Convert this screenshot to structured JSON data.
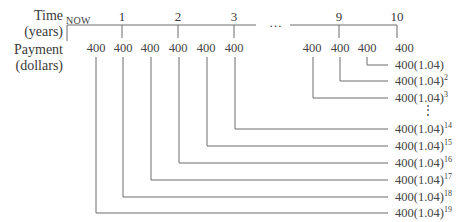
{
  "labels": {
    "time": "Time",
    "time_unit": "(years)",
    "payment": "Payment",
    "payment_unit": "(dollars)",
    "now": "NOW",
    "ellipsis": "…",
    "vdots": "⋮"
  },
  "time_ticks": [
    "1",
    "2",
    "3",
    "9",
    "10"
  ],
  "payments": [
    "400",
    "400",
    "400",
    "400",
    "400",
    "400",
    "400",
    "400",
    "400",
    "400"
  ],
  "future_values": [
    {
      "base": "400",
      "exp": ""
    },
    {
      "base": "400(1.04)",
      "exp": ""
    },
    {
      "base": "400(1.04)",
      "exp": "2"
    },
    {
      "base": "400(1.04)",
      "exp": "3"
    },
    {
      "base": "400(1.04)",
      "exp": "14"
    },
    {
      "base": "400(1.04)",
      "exp": "15"
    },
    {
      "base": "400(1.04)",
      "exp": "16"
    },
    {
      "base": "400(1.04)",
      "exp": "17"
    },
    {
      "base": "400(1.04)",
      "exp": "18"
    },
    {
      "base": "400(1.04)",
      "exp": "19"
    }
  ],
  "colors": {
    "line": "#6d6d6d",
    "text": "#3a3a3a"
  }
}
